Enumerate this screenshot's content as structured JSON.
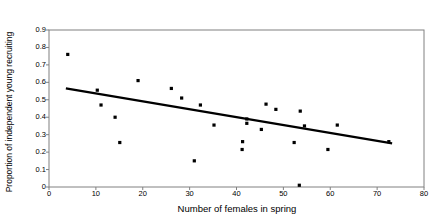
{
  "chart_data": {
    "type": "scatter",
    "title": "",
    "xlabel": "Number of females in spring",
    "ylabel": "Proportion of independent young recruiting",
    "xlim": [
      0,
      80
    ],
    "ylim": [
      0,
      0.9
    ],
    "xticks": [
      0,
      10,
      20,
      30,
      40,
      50,
      60,
      70,
      80
    ],
    "xtick_labels": [
      "0",
      "10",
      "20",
      "30",
      "40",
      "50",
      "60",
      "70",
      "80"
    ],
    "yticks": [
      0,
      0.1,
      0.2,
      0.3,
      0.4,
      0.5,
      0.6,
      0.7,
      0.8,
      0.9
    ],
    "ytick_labels": [
      "0",
      "0.1",
      "0.2",
      "0.3",
      "0.4",
      "0.5",
      "0.6",
      "0.7",
      "0.8",
      "0.9"
    ],
    "grid": false,
    "legend": null,
    "marker": "filled-square",
    "marker_color": "#000000",
    "points": [
      {
        "x": 4.0,
        "y": 0.76
      },
      {
        "x": 10.3,
        "y": 0.555
      },
      {
        "x": 11.1,
        "y": 0.47
      },
      {
        "x": 14.1,
        "y": 0.4
      },
      {
        "x": 15.1,
        "y": 0.255
      },
      {
        "x": 19.0,
        "y": 0.61
      },
      {
        "x": 26.1,
        "y": 0.565
      },
      {
        "x": 28.3,
        "y": 0.51
      },
      {
        "x": 31.0,
        "y": 0.15
      },
      {
        "x": 32.3,
        "y": 0.47
      },
      {
        "x": 35.2,
        "y": 0.355
      },
      {
        "x": 41.2,
        "y": 0.215
      },
      {
        "x": 41.3,
        "y": 0.26
      },
      {
        "x": 42.2,
        "y": 0.39
      },
      {
        "x": 42.2,
        "y": 0.365
      },
      {
        "x": 45.3,
        "y": 0.33
      },
      {
        "x": 46.3,
        "y": 0.475
      },
      {
        "x": 48.4,
        "y": 0.445
      },
      {
        "x": 52.3,
        "y": 0.255
      },
      {
        "x": 53.4,
        "y": 0.01
      },
      {
        "x": 53.6,
        "y": 0.435
      },
      {
        "x": 54.5,
        "y": 0.35
      },
      {
        "x": 59.5,
        "y": 0.215
      },
      {
        "x": 61.5,
        "y": 0.355
      },
      {
        "x": 72.5,
        "y": 0.26
      }
    ],
    "trendline": {
      "type": "linear",
      "x_start": 3.6,
      "y_start": 0.565,
      "x_end": 73.2,
      "y_end": 0.25,
      "color": "#000000",
      "width": 2.2
    },
    "frame_color": "#808080",
    "axis_color": "#808080"
  }
}
